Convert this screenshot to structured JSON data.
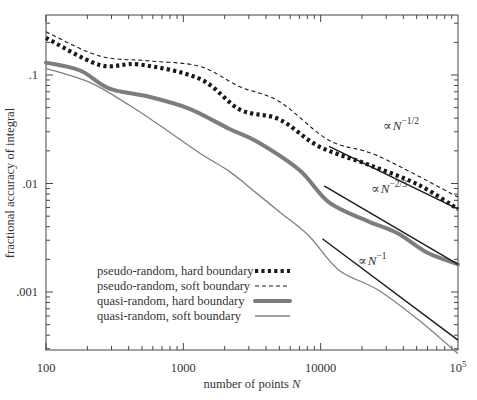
{
  "chart_data": {
    "type": "line",
    "title": "",
    "xlabel": "number of points N",
    "ylabel": "fractional accuracy of integral",
    "xscale": "log",
    "yscale": "log",
    "xlim": [
      100,
      100000
    ],
    "ylim": [
      0.00029,
      0.36
    ],
    "grid": false,
    "legend_position": "lower left",
    "x_ticks": [
      {
        "value": 100,
        "label": "100"
      },
      {
        "value": 1000,
        "label": "1000"
      },
      {
        "value": 10000,
        "label": "10000"
      },
      {
        "value": 100000,
        "label": "10",
        "sup": "5"
      }
    ],
    "y_ticks": [
      {
        "value": 0.1,
        "label": ".1"
      },
      {
        "value": 0.01,
        "label": ".01"
      },
      {
        "value": 0.001,
        "label": ".001"
      }
    ],
    "series": [
      {
        "name": "pseudo-random, hard boundary",
        "style": "dotted-thick",
        "color": "#1a1a1a",
        "x": [
          100,
          245,
          480,
          1320,
          2580,
          5000,
          9700,
          22000,
          51000,
          100000
        ],
        "y": [
          0.22,
          0.124,
          0.125,
          0.092,
          0.048,
          0.039,
          0.022,
          0.015,
          0.0098,
          0.0058
        ]
      },
      {
        "name": "pseudo-random, soft boundary",
        "style": "dashed-thin",
        "color": "#1a1a1a",
        "x": [
          100,
          245,
          565,
          1320,
          2580,
          5000,
          11500,
          26000,
          100000
        ],
        "y": [
          0.25,
          0.15,
          0.135,
          0.12,
          0.078,
          0.057,
          0.025,
          0.018,
          0.0075
        ]
      },
      {
        "name": "quasi-random, hard boundary",
        "style": "solid-thick",
        "color": "#808080",
        "x": [
          100,
          177,
          290,
          565,
          1100,
          2150,
          3500,
          7000,
          11500,
          22000,
          36000,
          60000,
          100000
        ],
        "y": [
          0.13,
          0.11,
          0.075,
          0.063,
          0.049,
          0.032,
          0.024,
          0.0133,
          0.0067,
          0.0045,
          0.0035,
          0.0023,
          0.0018
        ]
      },
      {
        "name": "quasi-random, soft boundary",
        "style": "solid-thin",
        "color": "#808080",
        "x": [
          100,
          210,
          410,
          680,
          1320,
          2150,
          3000,
          5000,
          8200,
          13500,
          26000,
          51000,
          100000
        ],
        "y": [
          0.115,
          0.085,
          0.052,
          0.034,
          0.019,
          0.013,
          0.0093,
          0.0055,
          0.0033,
          0.0016,
          0.00105,
          0.00056,
          0.00027
        ]
      }
    ],
    "reference_lines": [
      {
        "label": "∝N",
        "exponent": "−1/2",
        "x": [
          11500,
          100000
        ],
        "y": [
          0.022,
          0.0058
        ]
      },
      {
        "label": "∝N",
        "exponent": "−2/3",
        "x": [
          10600,
          100000
        ],
        "y": [
          0.0095,
          0.0018
        ]
      },
      {
        "label": "∝N",
        "exponent": "−1",
        "x": [
          10300,
          100000
        ],
        "y": [
          0.0031,
          0.00036
        ]
      }
    ]
  },
  "legend": {
    "items": [
      {
        "label": "pseudo-random, hard boundary",
        "style": "dotted-thick"
      },
      {
        "label": "pseudo-random, soft boundary",
        "style": "dashed-thin"
      },
      {
        "label": "quasi-random, hard boundary",
        "style": "solid-thick"
      },
      {
        "label": "quasi-random, soft boundary",
        "style": "solid-thin"
      }
    ]
  },
  "annotations": [
    {
      "prefix": "∝",
      "base": "N",
      "sup": "−1/2"
    },
    {
      "prefix": "∝",
      "base": "N",
      "sup": "−2/3"
    },
    {
      "prefix": "∝",
      "base": "N",
      "sup": "−1"
    }
  ],
  "axes": {
    "xlabel_text": "number of points ",
    "xlabel_var": "N",
    "ylabel_text": "fractional accuracy of integral"
  }
}
